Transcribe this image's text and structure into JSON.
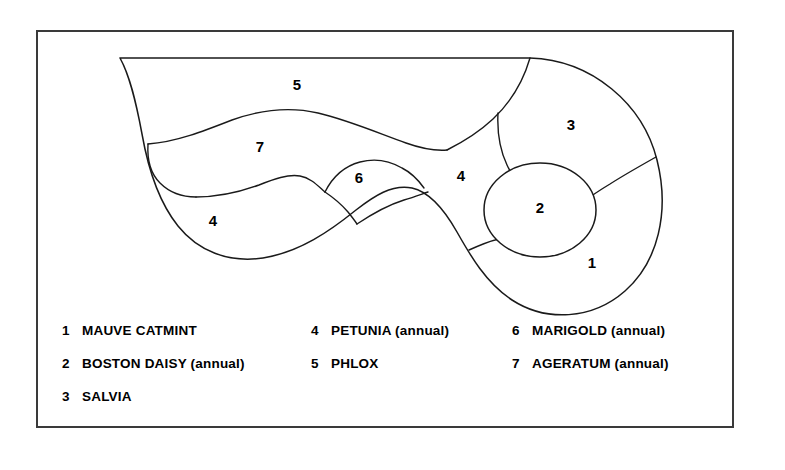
{
  "figure": {
    "frame": {
      "x": 36,
      "y": 30,
      "width": 698,
      "height": 398,
      "border_color": "#3a3a3a"
    },
    "line_color": "#1a1a1a",
    "background_color": "#ffffff"
  },
  "plots": [
    {
      "id": "plot-1",
      "number": "1",
      "label_x": 592,
      "label_y": 264
    },
    {
      "id": "plot-2",
      "number": "2",
      "label_x": 540,
      "label_y": 209
    },
    {
      "id": "plot-3",
      "number": "3",
      "label_x": 571,
      "label_y": 126
    },
    {
      "id": "plot-4-right",
      "number": "4",
      "label_x": 461,
      "label_y": 177
    },
    {
      "id": "plot-5",
      "number": "5",
      "label_x": 297,
      "label_y": 86
    },
    {
      "id": "plot-6",
      "number": "6",
      "label_x": 359,
      "label_y": 179
    },
    {
      "id": "plot-7",
      "number": "7",
      "label_x": 260,
      "label_y": 148
    },
    {
      "id": "plot-4-left",
      "number": "4",
      "label_x": 213,
      "label_y": 222
    }
  ],
  "legend": {
    "columns": [
      {
        "items": [
          {
            "number": "1",
            "name": "MAUVE CATMINT"
          },
          {
            "number": "2",
            "name": "BOSTON DAISY (annual)"
          },
          {
            "number": "3",
            "name": "SALVIA"
          }
        ]
      },
      {
        "items": [
          {
            "number": "4",
            "name": "PETUNIA (annual)"
          },
          {
            "number": "5",
            "name": "PHLOX"
          }
        ]
      },
      {
        "items": [
          {
            "number": "6",
            "name": "MARIGOLD (annual)"
          },
          {
            "number": "7",
            "name": "AGERATUM (annual)"
          }
        ]
      }
    ]
  }
}
